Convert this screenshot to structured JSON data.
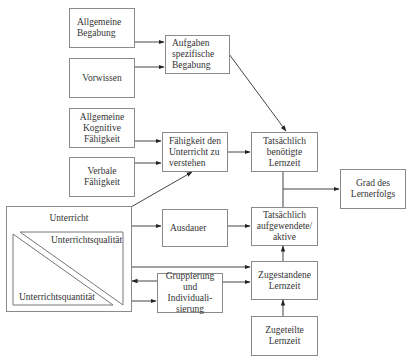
{
  "diagram": {
    "nodes": {
      "allgemeine_begabung": "Allgemeine\nBegabung",
      "vorwissen": "Vorwissen",
      "aufgaben_spezifische_begabung": "Aufgaben\nspezifische\nBegabung",
      "allgemeine_kognitive_faehigkeit": "Allgemeine\nKognitive\nFähigkeit",
      "verbale_faehigkeit": "Verbale\nFähigkeit",
      "faehigkeit_unterricht_verstehen": "Fähigkeit den\nUnterricht zu\nverstehen",
      "tatsaechlich_benoetigte_lernzeit": "Tatsächlich\nbenötigte\nLernzeit",
      "grad_des_lernerfolgs": "Grad des\nLernerfolgs",
      "unterricht": "Unterricht",
      "unterrichtsqualitaet": "Unterrichtsqualität",
      "unterrichtsquantitaet": "Unterrichtsquantität",
      "ausdauer": "Ausdauer",
      "tatsaechlich_aufgewendete_aktive": "Tatsächlich\naufgewendete/\naktive",
      "gruppierung_individualisierung": "Gruppierung\nund Individuali-\nsierung",
      "zugestandene_lernzeit": "Zugestandene\nLernzeit",
      "zugeteilte_lernzeit": "Zugeteilte\nLernzeit"
    },
    "edges": [
      {
        "from": "Allgemeine Begabung",
        "to": "Aufgaben spezifische Begabung"
      },
      {
        "from": "Vorwissen",
        "to": "Aufgaben spezifische Begabung"
      },
      {
        "from": "Aufgaben spezifische Begabung",
        "to": "Tatsächlich benötigte Lernzeit"
      },
      {
        "from": "Allgemeine Kognitive Fähigkeit",
        "to": "Fähigkeit den Unterricht zu verstehen"
      },
      {
        "from": "Verbale Fähigkeit",
        "to": "Fähigkeit den Unterricht zu verstehen"
      },
      {
        "from": "Unterricht",
        "to": "Fähigkeit den Unterricht zu verstehen"
      },
      {
        "from": "Fähigkeit den Unterricht zu verstehen",
        "to": "Tatsächlich benötigte Lernzeit"
      },
      {
        "from": "Tatsächlich benötigte Lernzeit / Tatsächlich aufgewendete",
        "to": "Grad des Lernerfolgs"
      },
      {
        "from": "Unterricht",
        "to": "Ausdauer"
      },
      {
        "from": "Ausdauer",
        "to": "Tatsächlich aufgewendete/ aktive"
      },
      {
        "from": "Unterricht",
        "to": "Zugestandene Lernzeit"
      },
      {
        "from": "Gruppierung und Individualisierung",
        "to": "Unterricht"
      },
      {
        "from": "Unterricht",
        "to": "Gruppierung und Individualisierung"
      },
      {
        "from": "Gruppierung und Individualisierung",
        "to": "Zugestandene Lernzeit"
      },
      {
        "from": "Zugestandene Lernzeit",
        "to": "Tatsächlich aufgewendete/ aktive"
      },
      {
        "from": "Zugeteilte Lernzeit",
        "to": "Zugestandene Lernzeit"
      }
    ]
  }
}
